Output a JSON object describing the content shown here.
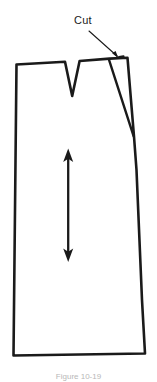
{
  "figure": {
    "annotations": {
      "cut_label": "Cut"
    },
    "caption": "Figure 10-19",
    "colors": {
      "ink": "#1a1a1a",
      "paper": "#ffffff",
      "caption": "#b8b8b8"
    },
    "parts": [
      {
        "name": "skirt-outline",
        "type": "polygon",
        "description": "Main skirt pattern body, waist at top, hem at bottom"
      },
      {
        "name": "waist-dart",
        "type": "v-dart",
        "description": "Narrow V-shaped dart at centre of waistline"
      },
      {
        "name": "slash-wedge",
        "type": "wedge",
        "description": "Spread slash opening near the right side seam"
      },
      {
        "name": "grainline-arrow",
        "type": "double-arrow",
        "description": "Vertical double-headed grainline arrow"
      },
      {
        "name": "cut-leader",
        "type": "leader-line",
        "description": "Leader line with arrowhead pointing to cut location"
      }
    ]
  }
}
